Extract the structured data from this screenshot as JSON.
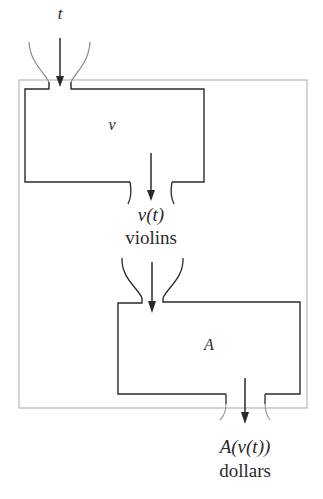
{
  "diagram": {
    "type": "function-composition",
    "input": {
      "label": "t"
    },
    "machines": [
      {
        "id": "v",
        "label": "v",
        "output_expr": "v(t)",
        "output_unit": "violins"
      },
      {
        "id": "A",
        "label": "A",
        "output_expr": "A(v(t))",
        "output_unit": "dollars"
      }
    ],
    "colors": {
      "stroke": "#2a2a2a",
      "outer_box": "#b8b8b8",
      "funnel": "#9a9a9a"
    }
  }
}
